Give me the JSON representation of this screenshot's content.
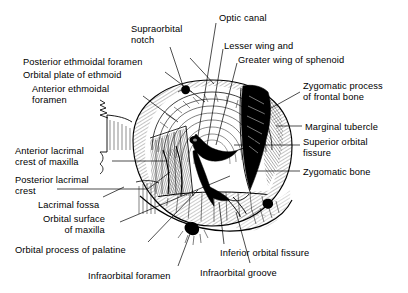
{
  "figure": {
    "kind": "anatomical-line-drawing",
    "style": "pen-and-ink hatched medical illustration",
    "background_color": "#ffffff",
    "ink_color": "#000000",
    "title": ""
  },
  "labels": [
    {
      "id": "supraorbital-notch",
      "text": "Supraorbital\nnotch",
      "align": "left",
      "x": 131,
      "y": 24
    },
    {
      "id": "optic-canal",
      "text": "Optic canal",
      "align": "left",
      "x": 219,
      "y": 13
    },
    {
      "id": "lesser-wing",
      "text": "Lesser wing and",
      "align": "left",
      "x": 224,
      "y": 41
    },
    {
      "id": "greater-wing-of-sphenoid",
      "text": "Greater wing of sphenoid",
      "align": "left",
      "x": 238,
      "y": 55
    },
    {
      "id": "posterior-ethmoidal-foramen",
      "text": "Posterior ethmoidal foramen",
      "align": "left",
      "x": 23,
      "y": 57
    },
    {
      "id": "orbital-plate-of-ethmoid",
      "text": "Orbital plate of ethmoid",
      "align": "left",
      "x": 23,
      "y": 70
    },
    {
      "id": "anterior-ethmoidal-foramen",
      "text": "Anterior ethmoidal\nforamen",
      "align": "left",
      "x": 32,
      "y": 84
    },
    {
      "id": "zygomatic-process-frontal",
      "text": "Zygomatic process\nof frontal bone",
      "align": "left",
      "x": 303,
      "y": 81
    },
    {
      "id": "marginal-tubercle",
      "text": "Marginal tubercle",
      "align": "left",
      "x": 305,
      "y": 122
    },
    {
      "id": "superior-orbital-fissure",
      "text": "Superior orbital\nfissure",
      "align": "left",
      "x": 303,
      "y": 137
    },
    {
      "id": "zygomatic-bone",
      "text": "Zygomatic bone",
      "align": "left",
      "x": 303,
      "y": 167
    },
    {
      "id": "anterior-lacrimal-crest",
      "text": "Anterior lacrimal\ncrest of maxilla",
      "align": "left",
      "x": 15,
      "y": 146
    },
    {
      "id": "posterior-lacrimal-crest",
      "text": "Posterior lacrimal\ncrest",
      "align": "left",
      "x": 15,
      "y": 175
    },
    {
      "id": "lacrimal-fossa",
      "text": "Lacrimal fossa",
      "align": "left",
      "x": 38,
      "y": 200
    },
    {
      "id": "orbital-surface-of-maxilla",
      "text": "Orbital surface\n        of maxilla",
      "align": "left",
      "x": 43,
      "y": 214
    },
    {
      "id": "orbital-process-of-palatine",
      "text": "Orbital process of palatine",
      "align": "left",
      "x": 15,
      "y": 245
    },
    {
      "id": "infraorbital-foramen",
      "text": "Infraorbital foramen",
      "align": "left",
      "x": 88,
      "y": 271
    },
    {
      "id": "inferior-orbital-fissure",
      "text": "Inferior orbital fissure",
      "align": "left",
      "x": 220,
      "y": 248
    },
    {
      "id": "infraorbital-groove",
      "text": "Infraorbital groove",
      "align": "left",
      "x": 200,
      "y": 268
    }
  ],
  "leader_lines": [
    {
      "id": "leader-supraorbital-notch",
      "points": "170,47 183,88"
    },
    {
      "id": "leader-optic-canal",
      "points": "216,23 198,160"
    },
    {
      "id": "leader-lesser-wing",
      "points": "222,47 207,158"
    },
    {
      "id": "leader-greater-wing",
      "points": "236,62 214,150"
    },
    {
      "id": "leader-posterior-ethmoidal-foramen",
      "points": "190,60 215,86"
    },
    {
      "id": "leader-orbital-plate-of-ethmoid",
      "points": "166,73 206,103"
    },
    {
      "id": "leader-anterior-ethmoidal-foramen",
      "points": "144,95 176,120"
    },
    {
      "id": "leader-zygomatic-process-frontal",
      "points": "300,92 268,112"
    },
    {
      "id": "leader-marginal-tubercle",
      "points": "302,126 277,126"
    },
    {
      "id": "leader-superior-orbital-fissure",
      "points": "300,146 236,146"
    },
    {
      "id": "leader-zygomatic-bone",
      "points": "300,171 259,171"
    },
    {
      "id": "leader-anterior-lacrimal-crest",
      "points": "112,161 166,161"
    },
    {
      "id": "leader-posterior-lacrimal-crest",
      "points": "57,189 146,189 171,172"
    },
    {
      "id": "leader-lacrimal-fossa",
      "points": "102,197 122,188"
    },
    {
      "id": "leader-orbital-surface-of-maxilla",
      "points": "120,221 228,178"
    },
    {
      "id": "leader-orbital-process-of-palatine",
      "points": "146,242 196,190"
    },
    {
      "id": "leader-infraorbital-foramen",
      "points": "178,266 192,228"
    },
    {
      "id": "leader-inferior-orbital-fissure",
      "points": "224,244 220,200"
    },
    {
      "id": "leader-infraorbital-groove",
      "points": "250,263 233,210"
    }
  ],
  "features": [
    {
      "id": "supraorbital-notch-mark",
      "shape": "dark-notch",
      "cx": 186,
      "cy": 89
    },
    {
      "id": "infraorbital-foramen-mark",
      "shape": "dark-oval",
      "cx": 192,
      "cy": 228
    },
    {
      "id": "zygomaticofacial-foramen-mark",
      "shape": "dark-oval",
      "cx": 268,
      "cy": 203
    },
    {
      "id": "orbital-rim-outline",
      "shape": "ellipse",
      "cx": 212,
      "cy": 155,
      "rx": 72,
      "ry": 68
    }
  ]
}
